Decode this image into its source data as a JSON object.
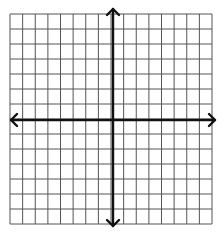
{
  "diagram": {
    "type": "coordinate-plane",
    "grid": {
      "columns": 16,
      "rows": 14,
      "left": 10,
      "top": 14,
      "right": 212,
      "bottom": 224,
      "line_color": "#555555",
      "line_width": 1
    },
    "axes": {
      "color": "#111111",
      "width": 2.4,
      "x_axis": {
        "y": 120,
        "x_start": 11,
        "x_end": 215,
        "arrows": [
          "left",
          "right"
        ]
      },
      "y_axis": {
        "x": 113,
        "y_start": 9,
        "y_end": 226,
        "arrows": [
          "up",
          "down"
        ]
      }
    },
    "background": "#ffffff"
  }
}
